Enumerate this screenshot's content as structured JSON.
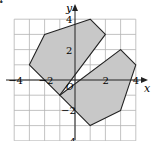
{
  "figure": {
    "type": "coordinate-plane",
    "corner_mark": "4",
    "axes": {
      "x_label": "x",
      "y_label": "y",
      "origin_label": "O",
      "x_ticks": [
        {
          "value": -4,
          "label": "−4"
        },
        {
          "value": -2,
          "label": "−2"
        },
        {
          "value": 2,
          "label": "2"
        },
        {
          "value": 4,
          "label": "4"
        }
      ],
      "y_ticks": [
        {
          "value": 4,
          "label": "4"
        },
        {
          "value": 2,
          "label": "2"
        },
        {
          "value": -2,
          "label": "−2"
        },
        {
          "value": -4,
          "label": "−4"
        }
      ],
      "x_range": [
        -4,
        4
      ],
      "y_range": [
        -4,
        4
      ],
      "grid": true,
      "grid_step": 1
    },
    "polygons": [
      {
        "name": "upper-left-polygon",
        "fill": "#c8c8c8",
        "stroke": "#222222",
        "vertices": [
          [
            -1,
            -1
          ],
          [
            -3,
            1
          ],
          [
            -2,
            3
          ],
          [
            1,
            4
          ],
          [
            2,
            3
          ]
        ]
      },
      {
        "name": "lower-right-polygon",
        "fill": "#c8c8c8",
        "stroke": "#222222",
        "vertices": [
          [
            -1,
            -1
          ],
          [
            3,
            2
          ],
          [
            4,
            1
          ],
          [
            3,
            -2
          ],
          [
            1,
            -3
          ]
        ]
      }
    ],
    "colors": {
      "grid": "#b4b4b4",
      "axis": "#222222",
      "shape_fill": "#c8c8c8",
      "shape_stroke": "#222222"
    }
  }
}
